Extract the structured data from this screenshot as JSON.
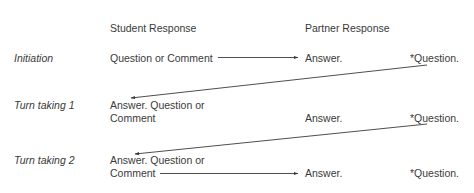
{
  "columns": {
    "student": "Student Response",
    "partner": "Partner Response"
  },
  "rows": [
    {
      "label": "Initiation",
      "student": [
        "Question or Comment"
      ],
      "partner_answer": "Answer.",
      "partner_question": "*Question."
    },
    {
      "label": "Turn taking 1",
      "student": [
        "Answer. Question or",
        "Comment"
      ],
      "partner_answer": "Answer.",
      "partner_question": "*Question."
    },
    {
      "label": "Turn taking 2",
      "student": [
        "Answer. Question or",
        "Comment"
      ],
      "partner_answer": "Answer.",
      "partner_question": "*Question."
    }
  ],
  "arrows": [
    {
      "from": "Initiation student",
      "to": "Initiation partner answer"
    },
    {
      "from": "Initiation partner question",
      "to": "Turn taking 1 student"
    },
    {
      "from": "Turn taking 1 partner question",
      "to": "Turn taking 2 student"
    },
    {
      "from": "Turn taking 2 student",
      "to": "Turn taking 2 partner answer"
    }
  ],
  "colors": {
    "text": "#3a3a3a",
    "line": "#3a3a3a"
  }
}
